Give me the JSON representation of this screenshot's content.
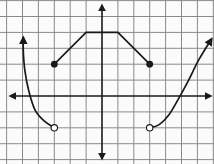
{
  "chart_data": {
    "type": "line",
    "title": "",
    "xlabel": "",
    "ylabel": "",
    "xlim": [
      -6.4,
      7
    ],
    "ylim": [
      -4.25,
      6
    ],
    "grid": true,
    "grid_step": 1,
    "axes_arrows": true,
    "colors": {
      "background": "#fbfbfb",
      "grid": "#8a8a8a",
      "axis": "#1a1a1a",
      "curve": "#1a1a1a"
    },
    "series": [
      {
        "name": "left-curve",
        "kind": "curve",
        "points": [
          [
            -3,
            -2
          ],
          [
            -3.6,
            -1.6
          ],
          [
            -4.2,
            -0.9
          ],
          [
            -4.6,
            0.3
          ],
          [
            -4.85,
            1.6
          ],
          [
            -4.95,
            2.8
          ],
          [
            -4.95,
            3.7
          ]
        ],
        "start_marker": "open",
        "end_marker": "arrow"
      },
      {
        "name": "middle-piecewise",
        "kind": "polyline",
        "points": [
          [
            -3,
            2
          ],
          [
            -1,
            4
          ],
          [
            1,
            4
          ],
          [
            3,
            2
          ]
        ],
        "start_marker": "closed",
        "end_marker": "closed"
      },
      {
        "name": "right-curve",
        "kind": "curve",
        "points": [
          [
            3,
            -2
          ],
          [
            3.6,
            -1.8
          ],
          [
            4.2,
            -1.2
          ],
          [
            4.8,
            -0.2
          ],
          [
            5.4,
            0.9
          ],
          [
            6.1,
            2.3
          ],
          [
            6.9,
            3.6
          ]
        ],
        "start_marker": "open",
        "end_marker": "arrow"
      }
    ]
  }
}
